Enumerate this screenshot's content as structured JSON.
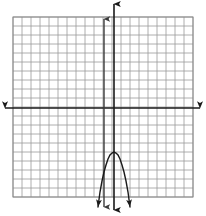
{
  "figure": {
    "width": 206,
    "height": 216,
    "background_color": "#ffffff"
  },
  "grid": {
    "label": "coordinate grid",
    "left": 13,
    "top": 17,
    "right": 193,
    "bottom": 197,
    "columns": 20,
    "rows": 20,
    "cell_size": 9,
    "line_color": "#9a9a9a",
    "line_width": 0.8,
    "border_color": "#8a8a8a"
  },
  "axes": {
    "x_axis": {
      "label": "x-axis",
      "y": 108,
      "x_start": 5,
      "x_end": 200,
      "color": "#1a1a1a",
      "width": 1.6,
      "arrow_left": true,
      "arrow_right": true
    },
    "y_axis": {
      "label": "y-axis",
      "x": 114,
      "y_start": 4,
      "y_end": 210,
      "color": "#1a1a1a",
      "width": 1.6,
      "arrow_up": true,
      "arrow_down": true
    },
    "secondary_vertical_line": {
      "label": "vertical line left of y-axis",
      "x": 104,
      "y_start": 19,
      "y_end": 207,
      "color": "#3a3a3a",
      "width": 1.4,
      "arrow_up": true,
      "arrow_down": true
    }
  },
  "chart_data": {
    "type": "line",
    "xlabel": "",
    "ylabel": "",
    "grid": true,
    "legend": null,
    "curve_color": "#1a1a1a",
    "curve_width": 1.4,
    "vertex_px": [
      114,
      152
    ],
    "opens": "down",
    "arrow_ends": [
      "down-left",
      "down-right"
    ],
    "points_px": [
      [
        98,
        207
      ],
      [
        100,
        192
      ],
      [
        102,
        181
      ],
      [
        104,
        172
      ],
      [
        106,
        165
      ],
      [
        108,
        159
      ],
      [
        110,
        155
      ],
      [
        112,
        153
      ],
      [
        114,
        152
      ],
      [
        116,
        153
      ],
      [
        118,
        155
      ],
      [
        120,
        159
      ],
      [
        122,
        165
      ],
      [
        124,
        172
      ],
      [
        126,
        181
      ],
      [
        128,
        192
      ],
      [
        130,
        207
      ]
    ]
  }
}
